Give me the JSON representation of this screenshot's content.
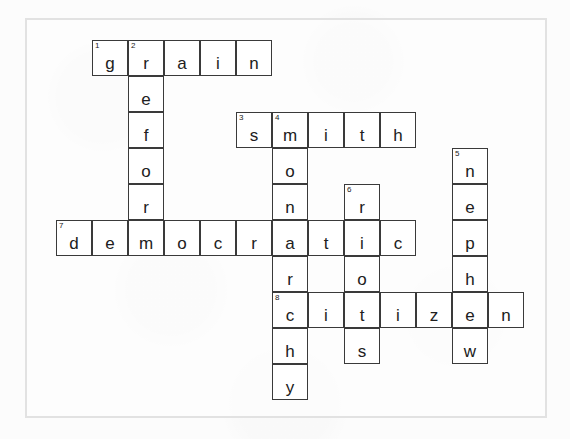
{
  "document": {
    "type": "crossword-puzzle",
    "title": "",
    "background_color": "#fcfcfc",
    "frame_color": "#e2e2e2",
    "cell_border_color": "#3a3a3a",
    "cell_fill_color": "#ffffff",
    "letter_color": "#202020"
  },
  "grid": {
    "origin_x": 56,
    "origin_y": 40,
    "cell_size": 36,
    "columns": 13,
    "rows": 10
  },
  "entries": [
    {
      "number": "1",
      "direction": "across",
      "answer": "grain",
      "row": 0,
      "col": 1
    },
    {
      "number": "2",
      "direction": "down",
      "answer": "reform",
      "row": 0,
      "col": 2
    },
    {
      "number": "3",
      "direction": "across",
      "answer": "smith",
      "row": 2,
      "col": 5
    },
    {
      "number": "4",
      "direction": "down",
      "answer": "monarchy",
      "row": 2,
      "col": 6
    },
    {
      "number": "5",
      "direction": "down",
      "answer": "nephew",
      "row": 3,
      "col": 11
    },
    {
      "number": "6",
      "direction": "down",
      "answer": "riots",
      "row": 4,
      "col": 8
    },
    {
      "number": "7",
      "direction": "across",
      "answer": "democratic",
      "row": 5,
      "col": 0
    },
    {
      "number": "8",
      "direction": "across",
      "answer": "citizen",
      "row": 7,
      "col": 6
    }
  ],
  "cells": [
    {
      "row": 0,
      "col": 1,
      "letter": "g",
      "number": "1"
    },
    {
      "row": 0,
      "col": 2,
      "letter": "r",
      "number": "2"
    },
    {
      "row": 0,
      "col": 3,
      "letter": "a",
      "number": ""
    },
    {
      "row": 0,
      "col": 4,
      "letter": "i",
      "number": ""
    },
    {
      "row": 0,
      "col": 5,
      "letter": "n",
      "number": ""
    },
    {
      "row": 1,
      "col": 2,
      "letter": "e",
      "number": ""
    },
    {
      "row": 2,
      "col": 2,
      "letter": "f",
      "number": ""
    },
    {
      "row": 3,
      "col": 2,
      "letter": "o",
      "number": ""
    },
    {
      "row": 4,
      "col": 2,
      "letter": "r",
      "number": ""
    },
    {
      "row": 2,
      "col": 5,
      "letter": "s",
      "number": "3"
    },
    {
      "row": 2,
      "col": 6,
      "letter": "m",
      "number": "4"
    },
    {
      "row": 2,
      "col": 7,
      "letter": "i",
      "number": ""
    },
    {
      "row": 2,
      "col": 8,
      "letter": "t",
      "number": ""
    },
    {
      "row": 2,
      "col": 9,
      "letter": "h",
      "number": ""
    },
    {
      "row": 3,
      "col": 6,
      "letter": "o",
      "number": ""
    },
    {
      "row": 4,
      "col": 6,
      "letter": "n",
      "number": ""
    },
    {
      "row": 6,
      "col": 6,
      "letter": "r",
      "number": ""
    },
    {
      "row": 8,
      "col": 6,
      "letter": "h",
      "number": ""
    },
    {
      "row": 9,
      "col": 6,
      "letter": "y",
      "number": ""
    },
    {
      "row": 3,
      "col": 11,
      "letter": "n",
      "number": "5"
    },
    {
      "row": 4,
      "col": 11,
      "letter": "e",
      "number": ""
    },
    {
      "row": 6,
      "col": 11,
      "letter": "h",
      "number": ""
    },
    {
      "row": 8,
      "col": 11,
      "letter": "w",
      "number": ""
    },
    {
      "row": 4,
      "col": 8,
      "letter": "r",
      "number": "6"
    },
    {
      "row": 6,
      "col": 8,
      "letter": "o",
      "number": ""
    },
    {
      "row": 8,
      "col": 8,
      "letter": "s",
      "number": ""
    },
    {
      "row": 5,
      "col": 0,
      "letter": "d",
      "number": "7"
    },
    {
      "row": 5,
      "col": 1,
      "letter": "e",
      "number": ""
    },
    {
      "row": 5,
      "col": 2,
      "letter": "m",
      "number": ""
    },
    {
      "row": 5,
      "col": 3,
      "letter": "o",
      "number": ""
    },
    {
      "row": 5,
      "col": 4,
      "letter": "c",
      "number": ""
    },
    {
      "row": 5,
      "col": 5,
      "letter": "r",
      "number": ""
    },
    {
      "row": 5,
      "col": 6,
      "letter": "a",
      "number": ""
    },
    {
      "row": 5,
      "col": 7,
      "letter": "t",
      "number": ""
    },
    {
      "row": 5,
      "col": 8,
      "letter": "i",
      "number": ""
    },
    {
      "row": 5,
      "col": 9,
      "letter": "c",
      "number": ""
    },
    {
      "row": 5,
      "col": 11,
      "letter": "p",
      "number": ""
    },
    {
      "row": 7,
      "col": 6,
      "letter": "c",
      "number": "8"
    },
    {
      "row": 7,
      "col": 7,
      "letter": "i",
      "number": ""
    },
    {
      "row": 7,
      "col": 8,
      "letter": "t",
      "number": ""
    },
    {
      "row": 7,
      "col": 9,
      "letter": "i",
      "number": ""
    },
    {
      "row": 7,
      "col": 10,
      "letter": "z",
      "number": ""
    },
    {
      "row": 7,
      "col": 11,
      "letter": "e",
      "number": ""
    },
    {
      "row": 7,
      "col": 12,
      "letter": "n",
      "number": ""
    }
  ]
}
